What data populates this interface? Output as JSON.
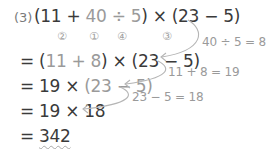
{
  "problem": {
    "number_label": "(3)",
    "expression": {
      "open": "(11 + ",
      "highlight": "40 ÷ 5",
      "rest": ") × (23 − 5)"
    },
    "order_marks": [
      "②",
      "①",
      "④",
      "③"
    ]
  },
  "steps": [
    {
      "prefix": "= (",
      "highlight": "11 + 8",
      "rest": ") × (23 − 5)"
    },
    {
      "prefix": "= 19 × ",
      "highlight": "(23 − 5)",
      "rest": ""
    },
    {
      "prefix": "= 19 × 18",
      "highlight": "",
      "rest": ""
    },
    {
      "prefix": "= ",
      "answer": "342"
    }
  ],
  "annotations": [
    {
      "text": "40 ÷ 5 = 8"
    },
    {
      "text": "11 + 8 = 19"
    },
    {
      "text": "23 − 5 = 18"
    }
  ],
  "colors": {
    "text": "#3a3a3a",
    "highlight": "#9a9a9a",
    "arrow": "#b0b0b0"
  }
}
